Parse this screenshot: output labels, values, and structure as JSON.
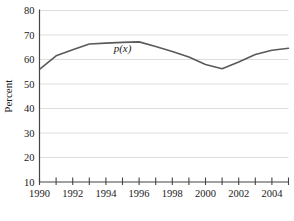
{
  "chart_data": {
    "type": "line",
    "title": "",
    "subtitle": "",
    "xlabel": "",
    "ylabel": "Percent",
    "xlim": [
      1990,
      2005
    ],
    "ylim": [
      10,
      80
    ],
    "ytick_step": 10,
    "grid": "horizontal",
    "legend": "none",
    "series_label": "p(x)",
    "series_label_x": 1995.0,
    "series_label_y": 63.0,
    "line_color": "#5a5a5a",
    "grid_color": "#d9d9d9",
    "axis_color": "#444444",
    "background_color": "#ffffff",
    "x": [
      1990,
      1991,
      1992,
      1993,
      1994,
      1995,
      1996,
      1997,
      1998,
      1999,
      2000,
      2001,
      2002,
      2003,
      2004,
      2005
    ],
    "values": [
      56.0,
      61.5,
      64.0,
      66.3,
      66.7,
      67.0,
      67.2,
      65.3,
      63.3,
      61.0,
      58.0,
      56.2,
      59.0,
      62.0,
      63.8,
      64.6
    ],
    "series": [
      {
        "name": "p(x)",
        "values": [
          56.0,
          61.5,
          64.0,
          66.3,
          66.7,
          67.0,
          67.2,
          65.3,
          63.3,
          61.0,
          58.0,
          56.2,
          59.0,
          62.0,
          63.8,
          64.6
        ]
      }
    ],
    "yticks": [
      10,
      20,
      30,
      40,
      50,
      60,
      70,
      80
    ],
    "ytick_labels": [
      "10",
      "20",
      "30",
      "40",
      "50",
      "60",
      "70",
      "80"
    ],
    "xticks": [
      1990,
      1991,
      1992,
      1993,
      1994,
      1995,
      1996,
      1997,
      1998,
      1999,
      2000,
      2001,
      2002,
      2003,
      2004,
      2005
    ],
    "xtick_labels": [
      "1990",
      "",
      "1992",
      "",
      "1994",
      "",
      "1996",
      "",
      "1998",
      "",
      "2000",
      "",
      "2002",
      "",
      "2004",
      ""
    ],
    "xtick_labels_visible": [
      "1990",
      "1992",
      "1994",
      "1996",
      "1998",
      "2000",
      "2002",
      "2004"
    ],
    "xtick_labels_visible_at": [
      1990,
      1992,
      1994,
      1996,
      1998,
      2000,
      2002,
      2004
    ]
  }
}
